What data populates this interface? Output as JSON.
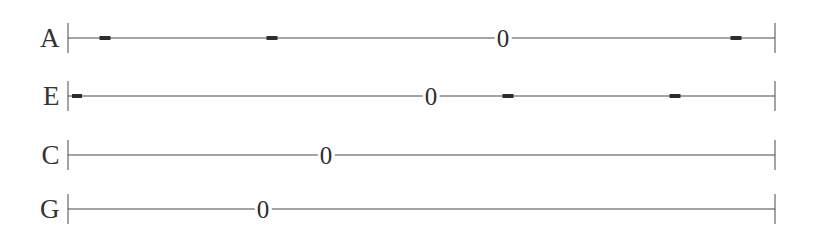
{
  "figure": {
    "type": "linkage-line-diagram",
    "background_color": "#ffffff",
    "line_color": "#4a4a4a",
    "marker_color": "#2e2e2e",
    "text_color": "#333333",
    "axis_start_x": 68,
    "axis_end_x": 775,
    "end_tick_height": 30
  },
  "tracks": [
    {
      "label": "A",
      "label_x": 60,
      "y": 38,
      "line_start_x": 68,
      "line_end_x": 775,
      "zero_label": "0",
      "zero_x": 503,
      "dashes": [
        {
          "x": 105,
          "width": 11
        },
        {
          "x": 272,
          "width": 11
        },
        {
          "x": 736,
          "width": 11
        }
      ]
    },
    {
      "label": "E",
      "label_x": 60,
      "y": 96,
      "line_start_x": 68,
      "line_end_x": 775,
      "zero_label": "0",
      "zero_x": 431,
      "dashes": [
        {
          "x": 77,
          "width": 10
        },
        {
          "x": 508,
          "width": 11
        },
        {
          "x": 675,
          "width": 11
        }
      ]
    },
    {
      "label": "C",
      "label_x": 60,
      "y": 155,
      "line_start_x": 68,
      "line_end_x": 775,
      "zero_label": "0",
      "zero_x": 326,
      "dashes": []
    },
    {
      "label": "G",
      "label_x": 60,
      "y": 209,
      "line_start_x": 68,
      "line_end_x": 775,
      "zero_label": "0",
      "zero_x": 263,
      "dashes": []
    }
  ]
}
